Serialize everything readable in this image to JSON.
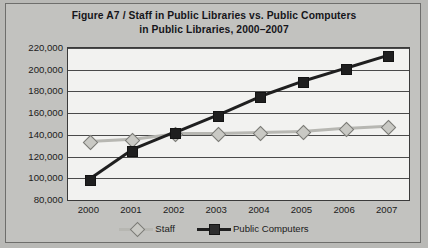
{
  "figure": {
    "label": "Figure A7",
    "separator": "/",
    "title_line1": "Staff in Public Libraries vs. Public Computers",
    "title_line2": "in Public Libraries, 2000–2007"
  },
  "colors": {
    "staff": "#b7b7b2",
    "staff_marker_fill": "#c9c9c4",
    "staff_marker_edge": "#7b7b76",
    "computers": "#1f1f1f",
    "plot_background": "#f2f2f0",
    "figure_background": "#c2c2bf",
    "grid": "#4a4a4a",
    "text": "#1b1b20"
  },
  "chart_data": {
    "type": "line",
    "xlabel": "",
    "ylabel": "",
    "x": [
      "2000",
      "2001",
      "2002",
      "2003",
      "2004",
      "2005",
      "2006",
      "2007"
    ],
    "categories": [
      "2000",
      "2001",
      "2002",
      "2003",
      "2004",
      "2005",
      "2006",
      "2007"
    ],
    "ylim": [
      80000,
      220000
    ],
    "ytick_values": [
      220000,
      200000,
      180000,
      160000,
      140000,
      120000,
      100000,
      80000
    ],
    "ytick_labels": [
      "220,000",
      "200,000",
      "180,000",
      "160,000",
      "140,000",
      "120,000",
      "100,000",
      "80,000"
    ],
    "grid": true,
    "legend_position": "bottom",
    "series": [
      {
        "name": "Staff",
        "marker": "diamond",
        "color": "#b7b7b2",
        "values": [
          134000,
          136000,
          141000,
          141000,
          142000,
          143000,
          146000,
          148000
        ]
      },
      {
        "name": "Public Computers",
        "marker": "square",
        "color": "#1f1f1f",
        "values": [
          99000,
          126000,
          142000,
          158000,
          175000,
          189000,
          201000,
          213000
        ]
      }
    ]
  },
  "legend": {
    "items": [
      {
        "label": "Staff",
        "marker": "diamond"
      },
      {
        "label": "Public Computers",
        "marker": "square"
      }
    ]
  }
}
